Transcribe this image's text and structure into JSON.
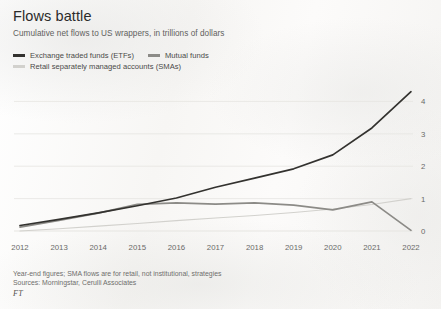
{
  "header": {
    "title": "Flows battle",
    "subtitle": "Cumulative net flows to US wrappers, in trillions of dollars"
  },
  "legend": [
    {
      "label": "Exchange traded funds (ETFs)",
      "color": "#33322f",
      "row": 0
    },
    {
      "label": "Mutual funds",
      "color": "#8c8b87",
      "row": 0
    },
    {
      "label": "Retail separately managed accounts (SMAs)",
      "color": "#d2d1cd",
      "row": 1
    }
  ],
  "footnotes": {
    "line1": "Year-end figures; SMA flows are for retail, not institutional, strategies",
    "line2": "Sources: Morningstar, Cerulli Associates",
    "brand": "FT"
  },
  "chart_data": {
    "type": "line",
    "title": "Flows battle",
    "subtitle": "Cumulative net flows to US wrappers, in trillions of dollars",
    "xlabel": "",
    "ylabel": "",
    "x": [
      2012,
      2013,
      2014,
      2015,
      2016,
      2017,
      2018,
      2019,
      2020,
      2021,
      2022
    ],
    "categories": [
      "2012",
      "2013",
      "2014",
      "2015",
      "2016",
      "2017",
      "2018",
      "2019",
      "2020",
      "2021",
      "2022"
    ],
    "xlim": [
      2012,
      2022
    ],
    "ylim": [
      0,
      4.6
    ],
    "yticks": [
      0,
      1,
      2,
      3,
      4
    ],
    "ytick_labels": [
      "0",
      "1",
      "2",
      "3",
      "4"
    ],
    "y_axis_position": "right",
    "grid": true,
    "grid_axis": "y",
    "legend_position": "top-left",
    "series": [
      {
        "name": "Exchange traded funds (ETFs)",
        "color": "#33322f",
        "values": [
          0.17,
          0.36,
          0.56,
          0.78,
          1.02,
          1.35,
          1.63,
          1.92,
          2.35,
          3.18,
          4.3
        ]
      },
      {
        "name": "Mutual funds",
        "color": "#8c8b87",
        "values": [
          0.12,
          0.33,
          0.55,
          0.82,
          0.87,
          0.83,
          0.87,
          0.8,
          0.65,
          0.9,
          0.02
        ]
      },
      {
        "name": "Retail separately managed accounts (SMAs)",
        "color": "#d2d1cd",
        "values": [
          0.0,
          0.07,
          0.15,
          0.23,
          0.32,
          0.4,
          0.48,
          0.57,
          0.68,
          0.82,
          1.0
        ]
      }
    ]
  }
}
